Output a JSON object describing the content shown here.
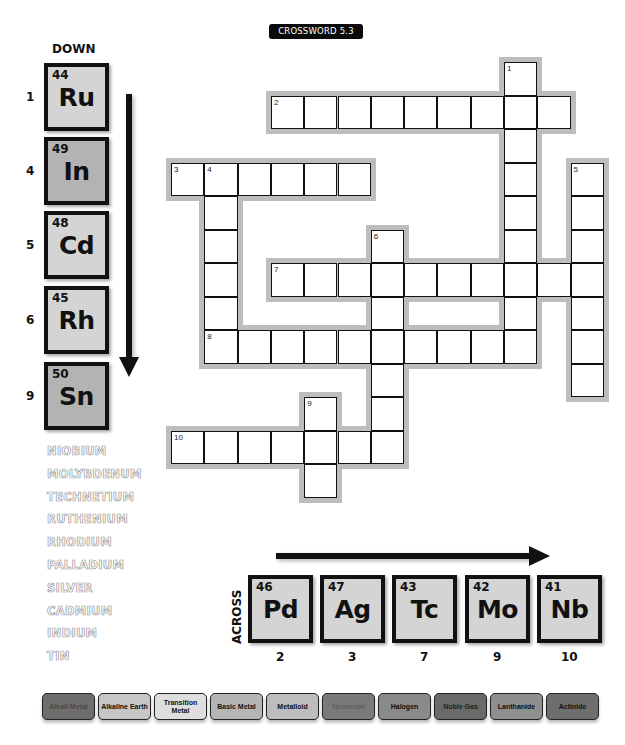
{
  "title": "CROSSWORD 5.3",
  "down": {
    "heading": "DOWN",
    "clues": [
      {
        "number": "1",
        "atomic_number": "44",
        "symbol": "Ru",
        "color": "#d4d4d4"
      },
      {
        "number": "4",
        "atomic_number": "49",
        "symbol": "In",
        "color": "#b3b3b3"
      },
      {
        "number": "5",
        "atomic_number": "48",
        "symbol": "Cd",
        "color": "#d4d4d4"
      },
      {
        "number": "6",
        "atomic_number": "45",
        "symbol": "Rh",
        "color": "#d4d4d4"
      },
      {
        "number": "9",
        "atomic_number": "50",
        "symbol": "Sn",
        "color": "#b3b3b3"
      }
    ]
  },
  "across": {
    "heading": "ACROSS",
    "clues": [
      {
        "number": "2",
        "atomic_number": "46",
        "symbol": "Pd",
        "color": "#d4d4d4"
      },
      {
        "number": "3",
        "atomic_number": "47",
        "symbol": "Ag",
        "color": "#d4d4d4"
      },
      {
        "number": "7",
        "atomic_number": "43",
        "symbol": "Tc",
        "color": "#d4d4d4"
      },
      {
        "number": "9",
        "atomic_number": "42",
        "symbol": "Mo",
        "color": "#d4d4d4"
      },
      {
        "number": "10",
        "atomic_number": "41",
        "symbol": "Nb",
        "color": "#d4d4d4"
      }
    ]
  },
  "word_bank": [
    "NIOBIUM",
    "MOLYBDENUM",
    "TECHNETIUM",
    "RUTHENIUM",
    "RHODIUM",
    "PALLADIUM",
    "SILVER",
    "CADMIUM",
    "INDIUM",
    "TIN"
  ],
  "grid": {
    "origin_x": 171,
    "origin_y": 62,
    "cell_w": 33.3,
    "cell_h": 33.5,
    "words": [
      {
        "label": "1",
        "dir": "down",
        "row": 0,
        "col": 10,
        "length": 9
      },
      {
        "label": "2",
        "dir": "across",
        "row": 1,
        "col": 3,
        "length": 9
      },
      {
        "label": "3",
        "dir": "across",
        "row": 3,
        "col": 0,
        "length": 6
      },
      {
        "label": "4",
        "dir": "down",
        "row": 3,
        "col": 1,
        "length": 6
      },
      {
        "label": "5",
        "dir": "down",
        "row": 3,
        "col": 12,
        "length": 7
      },
      {
        "label": "6",
        "dir": "down",
        "row": 5,
        "col": 6,
        "length": 7
      },
      {
        "label": "7",
        "dir": "across",
        "row": 6,
        "col": 3,
        "length": 10
      },
      {
        "label": "8",
        "dir": "across",
        "row": 8,
        "col": 1,
        "length": 10
      },
      {
        "label": "9",
        "dir": "down",
        "row": 10,
        "col": 4,
        "length": 3
      },
      {
        "label": "10",
        "dir": "across",
        "row": 11,
        "col": 0,
        "length": 7
      }
    ]
  },
  "legend": [
    {
      "label": "Alkali Metal",
      "bg": "#6e6e6e",
      "fg": "#4a4a4a"
    },
    {
      "label": "Alkaline Earth",
      "bg": "#c6c6c6",
      "fg": "#111111"
    },
    {
      "label": "Transition Metal",
      "bg": "#dedede",
      "fg": "#111111"
    },
    {
      "label": "Basic Metal",
      "bg": "#b5b5b5",
      "fg": "#111111"
    },
    {
      "label": "Metalloid",
      "bg": "#bdbdbd",
      "fg": "#111111"
    },
    {
      "label": "Nonmetal",
      "bg": "#7a7a7a",
      "fg": "#5e5e5e"
    },
    {
      "label": "Halogen",
      "bg": "#8a8a8a",
      "fg": "#111111"
    },
    {
      "label": "Noble Gas",
      "bg": "#6a6a6a",
      "fg": "#222222"
    },
    {
      "label": "Lanthanide",
      "bg": "#8f8f8f",
      "fg": "#111111"
    },
    {
      "label": "Actinide",
      "bg": "#6e6e6e",
      "fg": "#111111"
    }
  ]
}
